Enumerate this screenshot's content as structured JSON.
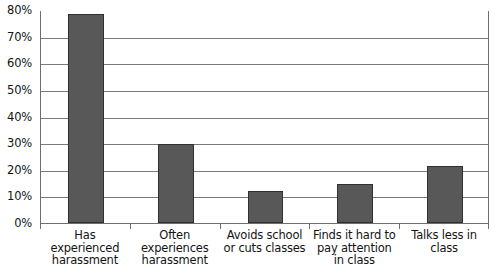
{
  "chart_data": {
    "type": "bar",
    "title": "",
    "subtitle": "",
    "xlabel": "",
    "ylabel": "",
    "categories": [
      "Has experienced harassment",
      "Often experiences harassment",
      "Avoids school or cuts classes",
      "Finds it hard to pay attention in class",
      "Talks less in class"
    ],
    "category_lines": [
      [
        "Has",
        "experienced",
        "harassment"
      ],
      [
        "Often",
        "experiences",
        "harassment"
      ],
      [
        "Avoids school",
        "or cuts classes"
      ],
      [
        "Finds it hard to",
        "pay attention",
        "in class"
      ],
      [
        "Talks less in",
        "class"
      ]
    ],
    "values": [
      78.5,
      29.7,
      12.0,
      14.5,
      21.5
    ],
    "value_labels": [
      "78.5%",
      "29.7%",
      "12%",
      "14.5%",
      "21.5%"
    ],
    "ylim": [
      0,
      80
    ],
    "ytick_values": [
      0,
      10,
      20,
      30,
      40,
      50,
      60,
      70,
      80
    ],
    "ytick_labels": [
      "0%",
      "10%",
      "20%",
      "30%",
      "40%",
      "50%",
      "60%",
      "70%",
      "80%"
    ],
    "grid": true,
    "legend": null,
    "legend_position": "none",
    "series_color": "#585858",
    "bar_outline_color": "#303030",
    "gridline_color": "#7a7a7a",
    "axis_color": "#6e6e6e",
    "background": "#ffffff",
    "text_color": "#141414"
  }
}
